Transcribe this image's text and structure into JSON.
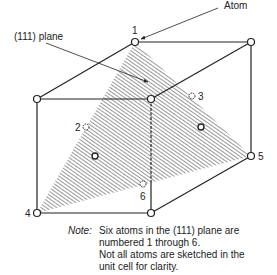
{
  "figure": {
    "labels": {
      "atom_callout": "Atom",
      "plane_callout": "(111) plane"
    },
    "atoms": [
      {
        "id": "1",
        "label": "1",
        "x": 135,
        "y": 42,
        "role": "corner",
        "in_plane": true
      },
      {
        "id": "2",
        "label": "2",
        "x": 86,
        "y": 127,
        "role": "face-center-hidden",
        "in_plane": true
      },
      {
        "id": "3",
        "label": "3",
        "x": 192,
        "y": 96,
        "role": "face-center-hidden",
        "in_plane": true
      },
      {
        "id": "4",
        "label": "4",
        "x": 37,
        "y": 213,
        "role": "corner",
        "in_plane": true
      },
      {
        "id": "5",
        "label": "5",
        "x": 251,
        "y": 156,
        "role": "corner",
        "in_plane": true
      },
      {
        "id": "6",
        "label": "6",
        "x": 143,
        "y": 184,
        "role": "face-center-hidden",
        "in_plane": true
      }
    ],
    "colors": {
      "line": "#222222",
      "hatch": "#333333",
      "background": "#ffffff"
    }
  },
  "note": {
    "key": "Note:",
    "lines": [
      "Six atoms in the (111) plane are",
      "numbered 1 through 6.",
      "Not all atoms are sketched in the",
      "unit cell for clarity."
    ]
  }
}
